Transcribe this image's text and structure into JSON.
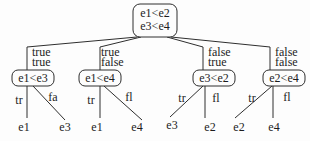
{
  "diagram": {
    "type": "decision-tree",
    "root": {
      "line1": "e1<e2",
      "line2": "e3<e4"
    },
    "branches": [
      {
        "edge_labels": [
          "true",
          "true"
        ],
        "node": "e1<e3",
        "children": [
          {
            "edge_label": "tr",
            "leaf": "e1"
          },
          {
            "edge_label": "fa",
            "leaf": "e3"
          }
        ]
      },
      {
        "edge_labels": [
          "true",
          "false"
        ],
        "node": "e1<e4",
        "children": [
          {
            "edge_label": "tr",
            "leaf": "e1"
          },
          {
            "edge_label": "fl",
            "leaf": "e4"
          }
        ]
      },
      {
        "edge_labels": [
          "false",
          "true"
        ],
        "node": "e3<e2",
        "children": [
          {
            "edge_label": "tr",
            "leaf": "e3"
          },
          {
            "edge_label": "fl",
            "leaf": "e2"
          }
        ]
      },
      {
        "edge_labels": [
          "false",
          "false"
        ],
        "node": "e2<e4",
        "children": [
          {
            "edge_label": "tr",
            "leaf": "e2"
          },
          {
            "edge_label": "fl",
            "leaf": "e4"
          }
        ]
      }
    ],
    "colors": {
      "line": "#2e2e2e",
      "text": "#1c1c1c",
      "background": "#fdfdfd"
    }
  }
}
